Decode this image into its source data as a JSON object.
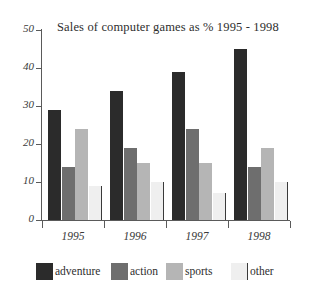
{
  "chart_data": {
    "type": "bar",
    "title": "Sales of computer games as % 1995 - 1998",
    "xlabel": "",
    "ylabel": "",
    "ylim": [
      0,
      50
    ],
    "ytick_labels": [
      "50",
      "40",
      "30",
      "20",
      "10",
      "0"
    ],
    "ytick_values": [
      50,
      40,
      30,
      20,
      10,
      0
    ],
    "categories": [
      "1995",
      "1996",
      "1997",
      "1998"
    ],
    "grid": false,
    "legend_position": "bottom",
    "series": [
      {
        "name": "adventure",
        "color": "#2b2b2b",
        "values": [
          29,
          34,
          39,
          45
        ]
      },
      {
        "name": "action",
        "color": "#6e6e6e",
        "values": [
          14,
          19,
          24,
          14
        ]
      },
      {
        "name": "sports",
        "color": "#b5b5b5",
        "values": [
          24,
          15,
          15,
          19
        ]
      },
      {
        "name": "other",
        "color": "#efefef",
        "values": [
          9,
          10,
          7,
          10
        ]
      }
    ]
  },
  "legend": {
    "items": [
      {
        "label": "adventure",
        "key": "adventure"
      },
      {
        "label": "action",
        "key": "action"
      },
      {
        "label": "sports",
        "key": "sports"
      },
      {
        "label": "other",
        "key": "other"
      }
    ]
  }
}
